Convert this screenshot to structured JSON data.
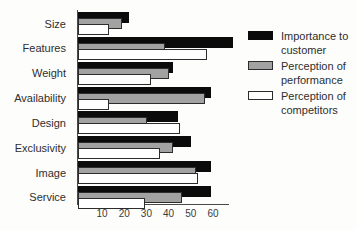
{
  "chart_data": {
    "type": "bar",
    "orientation": "horizontal",
    "title": "",
    "xlabel": "",
    "ylabel": "",
    "categories": [
      "Size",
      "Features",
      "Weight",
      "Availability",
      "Design",
      "Exclusivity",
      "Image",
      "Service"
    ],
    "series": [
      {
        "name": "Importance to customer",
        "color": "#0b0b0b",
        "values": [
          23,
          70,
          43,
          60,
          45,
          51,
          60,
          60
        ]
      },
      {
        "name": "Perception of performance",
        "color": "#a2a2a2",
        "values": [
          20,
          39,
          41,
          57,
          31,
          43,
          53,
          47
        ]
      },
      {
        "name": "Perception of competitors",
        "color": "#ffffff",
        "values": [
          14,
          58,
          33,
          14,
          46,
          37,
          54,
          30
        ]
      }
    ],
    "x_ticks": [
      10,
      20,
      30,
      40,
      50,
      60
    ],
    "xlim": [
      0,
      71
    ],
    "grid": false,
    "legend_position": "right"
  },
  "colors": {
    "axis": "#4a4a4a",
    "text": "#2e2e2e",
    "bar_border": "#2c2c2c",
    "background": "#fdfdfc"
  }
}
